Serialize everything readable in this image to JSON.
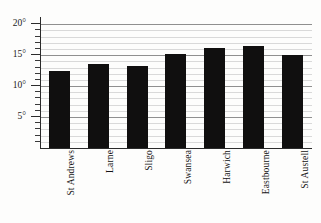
{
  "chart_data": {
    "type": "bar",
    "title": "",
    "subtitle": "",
    "xlabel": "",
    "ylabel": "",
    "categories": [
      "St Andrews",
      "Larne",
      "Sligo",
      "Swansea",
      "Harwich",
      "Eastbourne",
      "St Austell"
    ],
    "values": [
      12.5,
      13.5,
      13.3,
      15.2,
      16.1,
      16.4,
      15.0
    ],
    "unit": "°",
    "ylim": [
      0,
      21
    ],
    "y_major_ticks": [
      5,
      10,
      15,
      20
    ],
    "y_major_tick_labels": [
      "5°",
      "10°",
      "15°",
      "20°"
    ],
    "y_minor_tick_interval": 1,
    "grid": "horizontal",
    "legend": "none",
    "bar_color": "#100f0f",
    "gridline_color": "#d9d9d9",
    "major_gridline_color": "#8f8f8f",
    "axis_color": "#2b2b2b",
    "x_tick_label_rotation": 90,
    "background": "#fdfdfc"
  },
  "axes": {
    "y_labels": [
      {
        "text": "20°",
        "value": 20
      },
      {
        "text": "15°",
        "value": 15
      },
      {
        "text": "10°",
        "value": 10
      },
      {
        "text": "5°",
        "value": 5
      }
    ],
    "x_labels": [
      {
        "text": "St Andrews"
      },
      {
        "text": "Larne"
      },
      {
        "text": "Sligo"
      },
      {
        "text": "Swansea"
      },
      {
        "text": "Harwich"
      },
      {
        "text": "Eastbourne"
      },
      {
        "text": "St Austell"
      }
    ]
  }
}
